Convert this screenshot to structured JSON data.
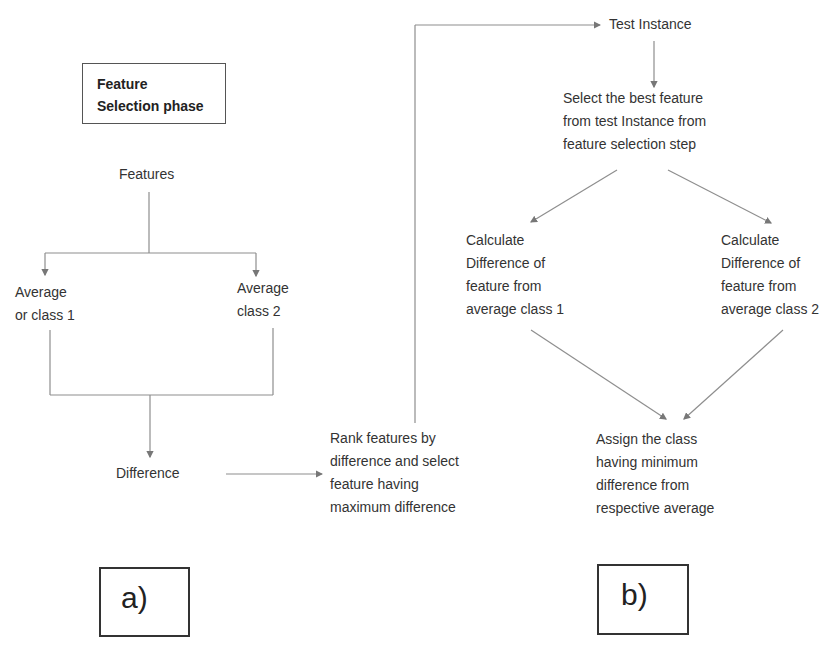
{
  "diagram": {
    "panel_a": {
      "title": "Feature Selection phase",
      "title_lines": [
        "Feature",
        "Selection phase"
      ],
      "label": "a)",
      "nodes": {
        "features": "Features",
        "avg_class1": [
          "Average",
          "or class 1"
        ],
        "avg_class2": [
          "Average",
          "class 2"
        ],
        "difference": "Difference",
        "rank": [
          "Rank features by",
          "difference and select",
          "feature having",
          "maximum difference"
        ]
      }
    },
    "panel_b": {
      "label": "b)",
      "nodes": {
        "test_instance": "Test Instance",
        "select_best": [
          "Select the best feature",
          "from test Instance from",
          "feature selection step"
        ],
        "calc_diff1": [
          "Calculate",
          "Difference of",
          "feature from",
          "average class 1"
        ],
        "calc_diff2": [
          "Calculate",
          "Difference of",
          "feature from",
          "average class 2"
        ],
        "assign": [
          "Assign the class",
          "having minimum",
          "difference from",
          "respective average"
        ]
      }
    },
    "edges": [
      {
        "from": "Features",
        "to": "Average or class 1"
      },
      {
        "from": "Features",
        "to": "Average class 2"
      },
      {
        "from": "Average or class 1",
        "to": "Difference"
      },
      {
        "from": "Average class 2",
        "to": "Difference"
      },
      {
        "from": "Difference",
        "to": "Rank features"
      },
      {
        "from": "Rank features",
        "to": "Test Instance"
      },
      {
        "from": "Test Instance",
        "to": "Select the best feature"
      },
      {
        "from": "Select the best feature",
        "to": "Calculate Difference class 1"
      },
      {
        "from": "Select the best feature",
        "to": "Calculate Difference class 2"
      },
      {
        "from": "Calculate Difference class 1",
        "to": "Assign the class"
      },
      {
        "from": "Calculate Difference class 2",
        "to": "Assign the class"
      }
    ],
    "colors": {
      "line": "#8a8a8a",
      "text": "#333333",
      "box_border": "#444444"
    }
  }
}
